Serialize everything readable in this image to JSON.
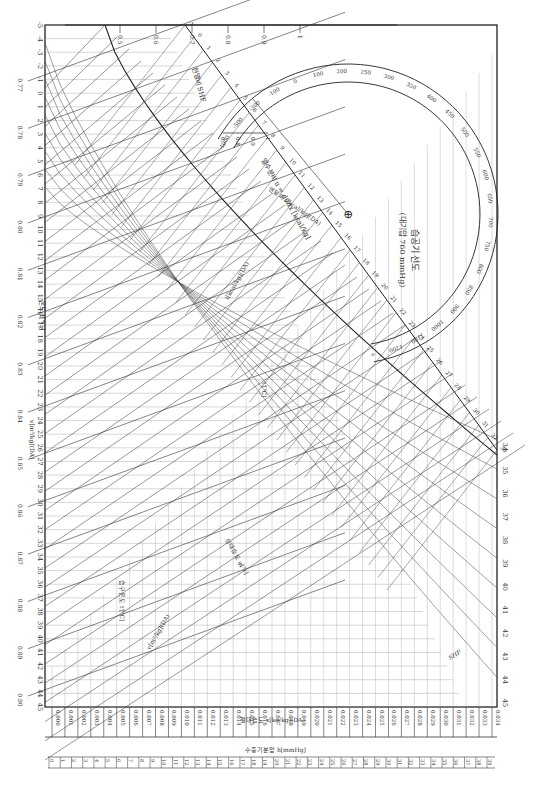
{
  "title": "습공기 선도",
  "subtitle": "(대기압 760 mmHg)",
  "chart_data": {
    "type": "psychrometric",
    "orientation": "rotated 90° clockwise",
    "dry_bulb_axis": {
      "label": "온도 t[℃]",
      "ticks": [
        -5,
        -4,
        -3,
        -2,
        -1,
        0,
        1,
        2,
        3,
        4,
        5,
        6,
        7,
        8,
        9,
        10,
        11,
        12,
        13,
        14,
        15,
        16,
        17,
        18,
        19,
        20,
        21,
        22,
        23,
        24,
        25,
        26,
        27,
        28,
        29,
        30,
        31,
        32,
        33,
        34,
        35,
        36,
        37,
        38,
        39,
        40,
        41,
        42,
        43,
        44,
        45
      ]
    },
    "specific_volume": {
      "label": "v[m³/kg](DA)",
      "ticks": [
        "0.77",
        "0.78",
        "0.79",
        "0.80",
        "0.81",
        "0.82",
        "0.83",
        "0.84",
        "0.85",
        "0.86",
        "0.87",
        "0.88",
        "0.89",
        "0.90"
      ]
    },
    "absolute_humidity_axis": {
      "label": "절대습도 x[kg/kg](DA)",
      "ticks": [
        "0.000",
        "0.001",
        "0.002",
        "0.003",
        "0.004",
        "0.005",
        "0.006",
        "0.007",
        "0.008",
        "0.009",
        "0.010",
        "0.011",
        "0.012",
        "0.013",
        "0.014",
        "0.015",
        "0.016",
        "0.017",
        "0.018",
        "0.019",
        "0.020",
        "0.021",
        "0.022",
        "0.023",
        "0.024",
        "0.025",
        "0.026",
        "0.027",
        "0.028",
        "0.029",
        "0.030",
        "0.031",
        "0.032",
        "0.033",
        "0.034"
      ]
    },
    "vapor_pressure_axis": {
      "label": "수증기분압 h[mmHg]",
      "ticks": [
        0,
        1,
        2,
        3,
        4,
        5,
        6,
        7,
        8,
        9,
        10,
        11,
        12,
        13,
        14,
        15,
        16,
        17,
        18,
        19,
        20,
        21,
        22,
        23,
        24,
        25,
        26,
        27,
        28,
        29,
        30,
        31,
        32,
        33,
        34,
        35,
        36,
        37,
        38,
        39
      ]
    },
    "enthalpy_scale": {
      "label": "엔탈피 i[kcal/kg](DA)",
      "ticks": [
        -1,
        0,
        1,
        2,
        3,
        4,
        5,
        6,
        7,
        8,
        9,
        10,
        11,
        12,
        13,
        14,
        15,
        16,
        17,
        18,
        19,
        20,
        21,
        22,
        23,
        24,
        25,
        26,
        27,
        28,
        29,
        30,
        31,
        32,
        33
      ]
    },
    "right_temp_ticks": [
      34,
      35,
      36,
      37,
      38,
      39,
      40,
      41,
      42,
      43,
      44,
      45
    ],
    "wet_bulb_label": "습구온도 t'[℃]",
    "relative_humidity_label": "상대습도 φ[%]",
    "dew_label": "t'[℃]",
    "shf_label": "현열비 SHF",
    "shf_ticks_top": [
      "0.5",
      "0.6",
      "0.7",
      "0.8",
      "0.9",
      "1"
    ],
    "shf_ticks_inner": [
      "0.7",
      "0.8",
      "0.9",
      "1"
    ],
    "shf_ticks_small": [
      "0.5",
      "0.6",
      "0.7"
    ],
    "heat_moisture_ratio": {
      "label": "열수분비 u = di/dx [kcal/kg]",
      "ticks": [
        "-1000",
        "-500",
        "-300",
        "-100",
        "0",
        "100",
        "200",
        "250",
        "300",
        "350",
        "400",
        "450",
        "500",
        "550",
        "600",
        "650",
        "700",
        "750",
        "800",
        "850",
        "900",
        "1000",
        "1100",
        "1200",
        "∞"
      ]
    }
  },
  "labels": {
    "temp_axis": "온도 t[℃]",
    "volume_axis": "v[m³/kg](DA)",
    "abs_humidity": "절대습도 x[kg/kg](DA)",
    "vapor_pressure": "수증기분압 h[mmHg]",
    "enthalpy": "엔탈피 i[kcal/kg](DA)",
    "enthalpy2": "i[kcal/kg](DA)",
    "wet_bulb": "습구온도 t'[℃]",
    "rel_humidity": "상대습도 φ[%]",
    "dew": "t'[℃]",
    "shf": "현열비 SHF",
    "shf_short": "SHF",
    "u_label": "열수분비 u = di/dx [kcal/kg]",
    "u_sym": "u",
    "ucross": "⊕",
    "vol_inner": "v[m³/kg](DA)"
  }
}
